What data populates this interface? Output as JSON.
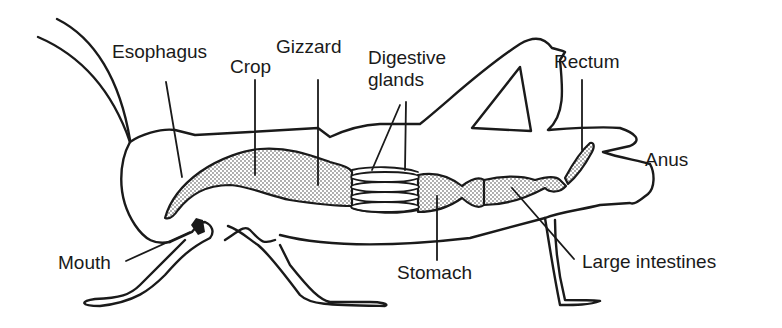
{
  "diagram": {
    "labels": {
      "esophagus": "Esophagus",
      "crop": "Crop",
      "gizzard": "Gizzard",
      "digestive_glands_line1": "Digestive",
      "digestive_glands_line2": "glands",
      "rectum": "Rectum",
      "anus": "Anus",
      "mouth": "Mouth",
      "stomach": "Stomach",
      "large_intestines": "Large intestines"
    },
    "colors": {
      "line": "#1a1a1a",
      "background": "#ffffff",
      "stipple": "#8a8a8a"
    }
  }
}
